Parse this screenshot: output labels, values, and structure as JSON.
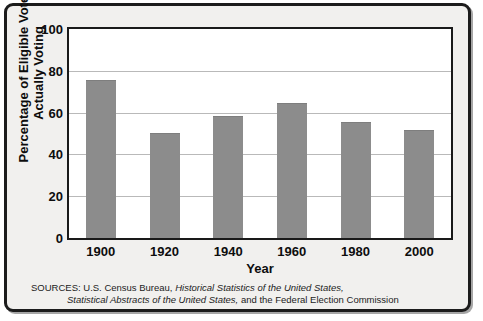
{
  "chart_data": {
    "type": "bar",
    "title": "",
    "categories": [
      "1900",
      "1920",
      "1940",
      "1960",
      "1980",
      "2000"
    ],
    "values": [
      75,
      50,
      58,
      64,
      55,
      51
    ],
    "xlabel": "Year",
    "ylabel": "Percentage of Eligible Voters Actually Voting",
    "ylim": [
      0,
      100
    ],
    "y_ticks": [
      "0",
      "20",
      "40",
      "60",
      "80",
      "100"
    ],
    "y_tick_values": [
      0,
      20,
      40,
      60,
      80,
      100
    ],
    "grid": true,
    "legend": "none",
    "bar_color": "#8c8c8c",
    "plot_background": "#ffffff",
    "figure_background": "#f1f0ee",
    "border_color": "#1c1c1c",
    "gridline_color": "#b9b9b9"
  },
  "axes": {
    "y_title_line1": "Percentage of Eligible Voters",
    "y_title_line2": "Actually Voting",
    "x_title": "Year"
  },
  "sources": {
    "label": "SOURCES:",
    "line1_plain_a": " U.S. Census Bureau, ",
    "line1_italic": "Historical Statistics of the United States,",
    "line2_italic": "Statistical Abstracts of the United States,",
    "line2_plain": " and the Federal Election Commission"
  }
}
